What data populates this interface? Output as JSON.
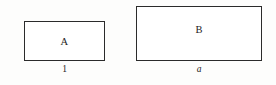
{
  "diagram": {
    "type": "geometry-figure",
    "background_color": "#fdfdfc",
    "stroke_color": "#2b2b2b",
    "fill_color": "#ffffff",
    "text_color": "#1d1d1d",
    "shapes": [
      {
        "id": "rect-a",
        "inner_label": "A",
        "dimension_label": "1",
        "dimension_label_style": "upright",
        "x": 24,
        "y": 21,
        "width": 81,
        "height": 40
      },
      {
        "id": "rect-b",
        "inner_label": "B",
        "dimension_label": "a",
        "dimension_label_style": "italic",
        "x": 136,
        "y": 6,
        "width": 126,
        "height": 55
      }
    ]
  }
}
